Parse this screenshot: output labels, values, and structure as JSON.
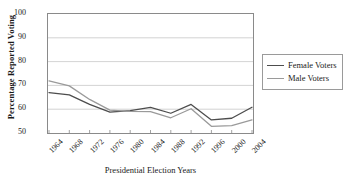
{
  "chart_data": {
    "type": "line",
    "title": "",
    "xlabel": "Presidential Election Years",
    "ylabel": "Percentage Reported Voting",
    "categories": [
      "1964",
      "1968",
      "1972",
      "1976",
      "1980",
      "1984",
      "1988",
      "1992",
      "1996",
      "2000",
      "2004"
    ],
    "x": [
      1964,
      1968,
      1972,
      1976,
      1980,
      1984,
      1988,
      1992,
      1996,
      2000,
      2004
    ],
    "series": [
      {
        "name": "Female Voters",
        "color": "#4d4d4d",
        "values": [
          67.0,
          66.0,
          62.0,
          58.8,
          59.4,
          60.8,
          58.3,
          62.0,
          55.5,
          56.2,
          60.8
        ]
      },
      {
        "name": "Male Voters",
        "color": "#9a9a9a",
        "values": [
          71.9,
          69.8,
          64.1,
          59.6,
          59.1,
          59.0,
          56.4,
          60.2,
          52.8,
          53.1,
          55.5
        ]
      }
    ],
    "ylim": [
      50,
      100
    ],
    "yticks": [
      50,
      60,
      70,
      80,
      90,
      100
    ],
    "ytick_labels": [
      "50",
      "60",
      "70",
      "80",
      "90",
      "100"
    ],
    "grid": true,
    "grid_axis": "y",
    "grid_color": "#c8c8c8",
    "legend_position": "right",
    "legend_entries": [
      "Female Voters",
      "Male Voters"
    ],
    "axis_color": "#8a8a8a",
    "background": "#ffffff"
  }
}
